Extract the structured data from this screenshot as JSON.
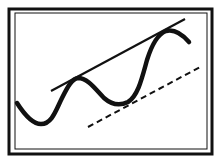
{
  "diagram": {
    "type": "trend-pattern-illustration",
    "colors": {
      "stroke": "#111111",
      "background": "#ffffff"
    },
    "frame": {
      "outer": [
        8,
        8,
        213,
        155
      ],
      "inner": [
        15,
        12,
        208,
        150
      ]
    },
    "wave_points": [
      [
        17,
        103
      ],
      [
        27,
        118
      ],
      [
        40,
        124
      ],
      [
        52,
        114
      ],
      [
        62,
        94
      ],
      [
        76,
        78
      ],
      [
        92,
        84
      ],
      [
        108,
        100
      ],
      [
        124,
        104
      ],
      [
        138,
        94
      ],
      [
        148,
        62
      ],
      [
        158,
        37
      ],
      [
        172,
        30
      ],
      [
        189,
        42
      ]
    ],
    "resistance_line": {
      "from": [
        51,
        91
      ],
      "to": [
        185,
        19
      ],
      "style": "solid"
    },
    "support_line": {
      "from": [
        88,
        127
      ],
      "to": [
        202,
        66
      ],
      "style": "dashed"
    }
  }
}
